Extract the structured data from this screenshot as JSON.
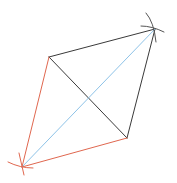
{
  "diagram": {
    "type": "geometric-construction",
    "colors": {
      "black": "#3a3a3a",
      "red": "#e0674f",
      "blue": "#8ec3e8"
    },
    "vertices": {
      "A": [
        22,
        167
      ],
      "B": [
        49,
        57
      ],
      "C": [
        155,
        29
      ],
      "D": [
        127,
        138
      ]
    },
    "segments": [
      {
        "from": "B",
        "to": "C",
        "color": "black"
      },
      {
        "from": "C",
        "to": "D",
        "color": "black"
      },
      {
        "from": "B",
        "to": "D",
        "color": "black"
      },
      {
        "from": "A",
        "to": "B",
        "color": "red"
      },
      {
        "from": "A",
        "to": "D",
        "color": "red"
      },
      {
        "from": "A",
        "to": "C",
        "color": "blue"
      }
    ]
  }
}
